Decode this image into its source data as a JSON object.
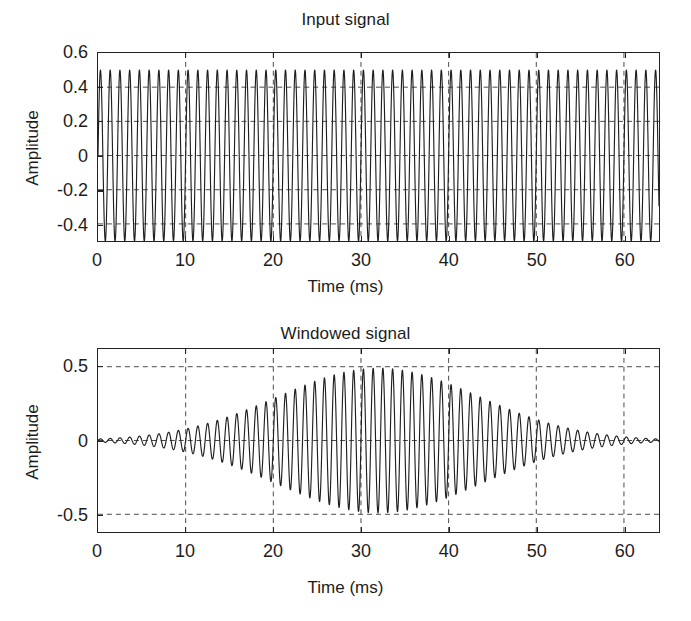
{
  "figure": {
    "background_color": "#ffffff",
    "line_color": "#1f1f1f",
    "grid_color": "#4a4a4a",
    "axis_color": "#232323"
  },
  "panels": [
    {
      "id": "input",
      "title": "Input signal",
      "xlabel": "Time (ms)",
      "ylabel": "Amplitude",
      "xticks": [
        "0",
        "10",
        "20",
        "30",
        "40",
        "50",
        "60"
      ],
      "yticks": [
        "0.6",
        "0.4",
        "0.2",
        "0",
        "-0.2",
        "-0.4"
      ]
    },
    {
      "id": "windowed",
      "title": "Windowed signal",
      "xlabel": "Time (ms)",
      "ylabel": "Amplitude",
      "xticks": [
        "0",
        "10",
        "20",
        "30",
        "40",
        "50",
        "60"
      ],
      "yticks": [
        "0.5",
        "0",
        "-0.5"
      ]
    }
  ],
  "chart_data": [
    {
      "type": "line",
      "id": "input-signal",
      "title": "Input signal",
      "xlabel": "Time (ms)",
      "ylabel": "Amplitude",
      "xlim": [
        0,
        64
      ],
      "ylim": [
        -0.5,
        0.6
      ],
      "xticks": [
        0,
        10,
        20,
        30,
        40,
        50,
        60
      ],
      "yticks": [
        0.6,
        0.4,
        0.2,
        0,
        -0.2,
        -0.4
      ],
      "grid": true,
      "grid_style": "dashed",
      "legend": null,
      "series": [
        {
          "name": "input",
          "description": "Constant-amplitude sinusoid, amplitude 0.5, frequency about 0.9 cycles per ms (900 Hz), spanning the full 0 to 64 ms window",
          "waveform": "sine",
          "amplitude": 0.5,
          "frequency_cycles_per_ms": 0.9,
          "phase_rad": 0,
          "offset": 0,
          "envelope": "constant"
        }
      ]
    },
    {
      "type": "line",
      "id": "windowed-signal",
      "title": "Windowed signal",
      "xlabel": "Time (ms)",
      "ylabel": "Amplitude",
      "xlim": [
        0,
        64
      ],
      "ylim": [
        -0.62,
        0.62
      ],
      "xticks": [
        0,
        10,
        20,
        30,
        40,
        50,
        60
      ],
      "yticks": [
        0.5,
        0,
        -0.5
      ],
      "grid": true,
      "grid_style": "dashed",
      "legend": null,
      "series": [
        {
          "name": "windowed",
          "description": "Same sinusoid multiplied by a smooth bell-shaped (Gaussian-like) window centred near 32 ms; peak amplitude about 0.5 near the centre, tapering to near zero at both ends",
          "waveform": "sine",
          "amplitude": 0.5,
          "frequency_cycles_per_ms": 0.9,
          "phase_rad": 0,
          "offset": 0,
          "envelope": "gaussian",
          "envelope_center_ms": 32,
          "envelope_sigma_ms": 11.5,
          "envelope_samples": [
            {
              "t": 0,
              "a": 0.01
            },
            {
              "t": 4,
              "a": 0.02
            },
            {
              "t": 8,
              "a": 0.05
            },
            {
              "t": 12,
              "a": 0.12
            },
            {
              "t": 16,
              "a": 0.22
            },
            {
              "t": 20,
              "a": 0.33
            },
            {
              "t": 24,
              "a": 0.43
            },
            {
              "t": 28,
              "a": 0.49
            },
            {
              "t": 32,
              "a": 0.5
            },
            {
              "t": 36,
              "a": 0.49
            },
            {
              "t": 40,
              "a": 0.43
            },
            {
              "t": 44,
              "a": 0.33
            },
            {
              "t": 48,
              "a": 0.22
            },
            {
              "t": 52,
              "a": 0.12
            },
            {
              "t": 56,
              "a": 0.05
            },
            {
              "t": 60,
              "a": 0.02
            },
            {
              "t": 64,
              "a": 0.01
            }
          ]
        }
      ]
    }
  ]
}
